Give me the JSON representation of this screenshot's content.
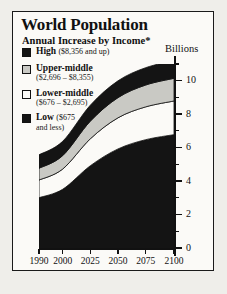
{
  "chart": {
    "title": "World Population",
    "subtitle": "Annual Increase by Income*",
    "footnote": "*US dollars",
    "y_axis_title": "Billions"
  },
  "legend": {
    "items": [
      {
        "name": "High",
        "range": "($8,356 and up)",
        "swatch": "black",
        "color": "#141414"
      },
      {
        "name": "Upper-middle",
        "range": "($2,696 – $8,355)",
        "swatch": "light-gray",
        "color": "#c9c9c4"
      },
      {
        "name": "Lower-middle",
        "range": "($676 – $2,695)",
        "swatch": "white",
        "color": "#fbfaf7"
      },
      {
        "name": "Low",
        "range": "($675",
        "range2": "and less)",
        "swatch": "black",
        "color": "#141414"
      }
    ]
  },
  "chart_data": {
    "type": "area",
    "stacked": true,
    "title": "World Population",
    "subtitle": "Annual Increase by Income*",
    "xlabel": "",
    "ylabel": "Billions",
    "ylim": [
      0,
      11
    ],
    "yticks": [
      0,
      2,
      4,
      6,
      8,
      10
    ],
    "ytick_labels": [
      "0",
      "2",
      "4",
      "6",
      "8",
      "10"
    ],
    "y_minor_ticks": [
      1,
      3,
      5,
      7,
      9,
      11
    ],
    "grid": false,
    "legend_position": "upper-left",
    "x": [
      1990,
      2000,
      2025,
      2050,
      2075,
      2100
    ],
    "x_tick_labels": [
      "1990",
      "2000",
      "2025",
      "2050",
      "2075",
      "2100"
    ],
    "x_spacing": "non-linear",
    "series": [
      {
        "name": "Low",
        "color": "#141414",
        "values": [
          3.05,
          3.55,
          4.95,
          5.95,
          6.5,
          6.8
        ]
      },
      {
        "name": "Lower-middle",
        "color": "#fbfaf7",
        "values": [
          1.05,
          1.2,
          1.6,
          1.85,
          1.95,
          2.0
        ]
      },
      {
        "name": "Upper-middle",
        "color": "#c9c9c4",
        "values": [
          0.7,
          0.8,
          1.05,
          1.2,
          1.3,
          1.35
        ]
      },
      {
        "name": "High",
        "color": "#141414",
        "values": [
          0.8,
          0.85,
          0.95,
          1.0,
          1.03,
          1.05
        ]
      }
    ],
    "totals": [
      5.6,
      6.4,
      8.55,
      10.0,
      10.78,
      11.2
    ]
  }
}
